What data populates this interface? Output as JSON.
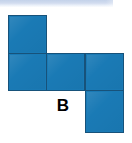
{
  "figure": {
    "label": "B",
    "type": "cube-net-diagram",
    "square_color": "#1a7ab5",
    "square_border_color": "#17527a",
    "background_color": "#ffffff",
    "top_band_color": "#c3d2ea",
    "grid": {
      "columns": 3,
      "rows": 3,
      "cells": [
        {
          "id": "cell-r1c1",
          "row": 1,
          "column": 1,
          "filled": true
        },
        {
          "id": "cell-r1c2",
          "row": 1,
          "column": 2,
          "filled": false
        },
        {
          "id": "cell-r1c3",
          "row": 1,
          "column": 3,
          "filled": false
        },
        {
          "id": "cell-r2c1",
          "row": 2,
          "column": 1,
          "filled": true
        },
        {
          "id": "cell-r2c2",
          "row": 2,
          "column": 2,
          "filled": true
        },
        {
          "id": "cell-r2c3",
          "row": 2,
          "column": 3,
          "filled": true
        },
        {
          "id": "cell-r3c1",
          "row": 3,
          "column": 1,
          "filled": false
        },
        {
          "id": "cell-r3c2",
          "row": 3,
          "column": 2,
          "filled": false
        },
        {
          "id": "cell-r3c3",
          "row": 3,
          "column": 3,
          "filled": true
        }
      ],
      "filled_count": 5
    }
  }
}
